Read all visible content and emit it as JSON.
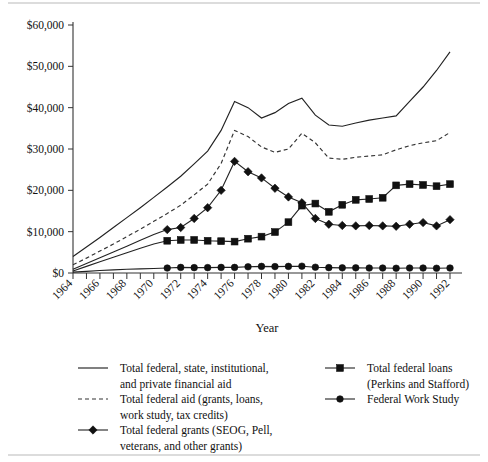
{
  "chart_data": {
    "type": "line",
    "title": "",
    "xlabel": "Year",
    "ylabel": "",
    "xlim": [
      1964,
      1992
    ],
    "ylim": [
      0,
      60000
    ],
    "ytick_labels": [
      "$0",
      "$10,000",
      "$20,000",
      "$30,000",
      "$40,000",
      "$50,000",
      "$60,000"
    ],
    "ytick_values": [
      0,
      10000,
      20000,
      30000,
      40000,
      50000,
      60000
    ],
    "xtick_labels": [
      "1964",
      "1966",
      "1968",
      "1970",
      "1972",
      "1974",
      "1976",
      "1978",
      "1980",
      "1982",
      "1984",
      "1986",
      "1988",
      "1990",
      "1992"
    ],
    "xtick_values": [
      1964,
      1966,
      1968,
      1970,
      1972,
      1974,
      1976,
      1978,
      1980,
      1982,
      1984,
      1986,
      1988,
      1990,
      1992
    ],
    "grid": false,
    "legend_position": "below",
    "x": [
      1964,
      1965,
      1966,
      1967,
      1968,
      1969,
      1970,
      1971,
      1972,
      1973,
      1974,
      1975,
      1976,
      1977,
      1978,
      1979,
      1980,
      1981,
      1982,
      1983,
      1984,
      1985,
      1986,
      1987,
      1988,
      1989,
      1990,
      1991,
      1992
    ],
    "series": [
      {
        "name": "Total federal, state, institutional, and private financial aid",
        "style": "solid",
        "marker": "none",
        "values": [
          4000,
          6300,
          8600,
          11000,
          13400,
          15800,
          18300,
          20800,
          23400,
          26400,
          29500,
          34500,
          41500,
          40000,
          37500,
          38800,
          41000,
          42300,
          38200,
          35800,
          35500,
          36300,
          37000,
          37500,
          38000,
          41500,
          45000,
          49000,
          53500
        ]
      },
      {
        "name": "Total federal aid (grants, loans, work study, tax credits)",
        "style": "dashed",
        "marker": "none",
        "values": [
          2000,
          3600,
          5300,
          7000,
          8800,
          10600,
          12500,
          14400,
          16400,
          18900,
          21500,
          26500,
          34500,
          33000,
          30500,
          29200,
          30000,
          33800,
          31500,
          27800,
          27500,
          28000,
          28300,
          28600,
          29800,
          30800,
          31500,
          32000,
          34000
        ]
      },
      {
        "name": "Total federal grants (SEOG, Pell, veterans, and other grants)",
        "style": "solid",
        "marker": "diamond",
        "values": [
          900,
          2300,
          3700,
          5100,
          6500,
          7900,
          9300,
          10500,
          11000,
          13200,
          15800,
          20000,
          27000,
          24500,
          23000,
          20500,
          18400,
          17000,
          13200,
          11800,
          11500,
          11400,
          11500,
          11400,
          11300,
          11800,
          12200,
          11400,
          12900
        ]
      },
      {
        "name": "Total federal loans (Perkins and Stafford)",
        "style": "solid",
        "marker": "square",
        "values": [
          500,
          1600,
          2700,
          3800,
          4900,
          6000,
          7000,
          7800,
          8000,
          8000,
          7800,
          7700,
          7600,
          8300,
          8800,
          9900,
          12300,
          16300,
          16800,
          14800,
          16500,
          17700,
          17900,
          18200,
          21200,
          21500,
          21300,
          21000,
          21500
        ]
      },
      {
        "name": "Federal Work Study",
        "style": "solid",
        "marker": "circle",
        "values": [
          200,
          400,
          600,
          750,
          900,
          1000,
          1100,
          1200,
          1350,
          1300,
          1300,
          1350,
          1350,
          1500,
          1600,
          1550,
          1600,
          1650,
          1400,
          1300,
          1250,
          1250,
          1200,
          1200,
          1150,
          1200,
          1200,
          1150,
          1200
        ]
      }
    ]
  },
  "legend": {
    "entries": [
      {
        "marker": "line",
        "line1": "Total federal, state, institutional,",
        "line2": "and private financial aid"
      },
      {
        "marker": "dashed",
        "line1": "Total federal aid (grants, loans,",
        "line2": "work study, tax credits)"
      },
      {
        "marker": "diamond",
        "line1": "Total federal grants (SEOG, Pell,",
        "line2": "veterans, and other grants)"
      },
      {
        "marker": "square",
        "line1": "Total federal loans",
        "line2": "(Perkins and Stafford)"
      },
      {
        "marker": "circle",
        "line1": "Federal Work Study",
        "line2": ""
      }
    ]
  },
  "colors": {
    "ink": "#111111",
    "axis": "#333333",
    "background": "#ffffff",
    "separator": "#b9b9b9"
  }
}
